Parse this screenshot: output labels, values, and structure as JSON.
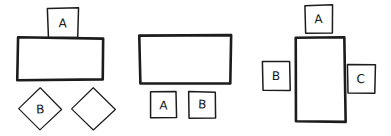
{
  "document": {
    "title": "Hand-drawn shapes diagram",
    "background_color": "#ffffff",
    "ink_color": "#1c1c1c",
    "width": 391,
    "height": 136
  },
  "groups": [
    {
      "id": "group-1",
      "shapes": [
        {
          "id": "g1-square-a",
          "kind": "square",
          "label": "A",
          "x": 48,
          "y": 8,
          "w": 30,
          "h": 30,
          "stroke": "medium"
        },
        {
          "id": "g1-rectangle",
          "kind": "rectangle",
          "label": "",
          "x": 18,
          "y": 38,
          "w": 85,
          "h": 42,
          "stroke": "heavy"
        },
        {
          "id": "g1-diamond-b",
          "kind": "diamond",
          "label": "B",
          "x": 18,
          "y": 88,
          "w": 44,
          "h": 42,
          "stroke": "light"
        },
        {
          "id": "g1-diamond-empty",
          "kind": "diamond",
          "label": "",
          "x": 72,
          "y": 88,
          "w": 43,
          "h": 42,
          "stroke": "light"
        }
      ]
    },
    {
      "id": "group-2",
      "shapes": [
        {
          "id": "g2-rectangle",
          "kind": "rectangle",
          "label": "",
          "x": 140,
          "y": 35,
          "w": 91,
          "h": 48,
          "stroke": "heavy"
        },
        {
          "id": "g2-square-a",
          "kind": "square",
          "label": "A",
          "x": 150,
          "y": 92,
          "w": 26,
          "h": 26,
          "stroke": "medium"
        },
        {
          "id": "g2-square-b",
          "kind": "square",
          "label": "B",
          "x": 189,
          "y": 92,
          "w": 26,
          "h": 26,
          "stroke": "medium"
        }
      ]
    },
    {
      "id": "group-3",
      "shapes": [
        {
          "id": "g3-square-a",
          "kind": "square",
          "label": "A",
          "x": 305,
          "y": 5,
          "w": 28,
          "h": 28,
          "stroke": "medium"
        },
        {
          "id": "g3-rectangle-tall",
          "kind": "rectangle",
          "label": "",
          "x": 296,
          "y": 37,
          "w": 49,
          "h": 85,
          "stroke": "heavy"
        },
        {
          "id": "g3-square-b",
          "kind": "square",
          "label": "B",
          "x": 263,
          "y": 62,
          "w": 27,
          "h": 28,
          "stroke": "medium"
        },
        {
          "id": "g3-square-c",
          "kind": "square",
          "label": "C",
          "x": 348,
          "y": 65,
          "w": 27,
          "h": 28,
          "stroke": "medium"
        }
      ]
    }
  ]
}
